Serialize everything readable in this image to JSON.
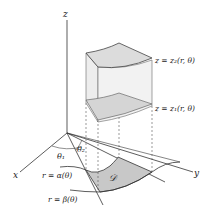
{
  "axes": {
    "x_label": "x",
    "y_label": "y",
    "z_label": "z"
  },
  "surfaces": {
    "upper": "z = z₂(r, θ)",
    "lower": "z = z₁(r, θ)"
  },
  "curves": {
    "inner": "r = α(θ)",
    "outer": "r = β(θ)"
  },
  "angles": {
    "theta1": "θ₁",
    "theta2": "θ₂"
  },
  "region": {
    "label": "𝒟"
  },
  "colors": {
    "axis": "#333333",
    "region_fill": "#c8c8c8",
    "solid_top": "#e2e2e2",
    "solid_side": "#ececec",
    "solid_bottom": "#cfcfcf"
  }
}
